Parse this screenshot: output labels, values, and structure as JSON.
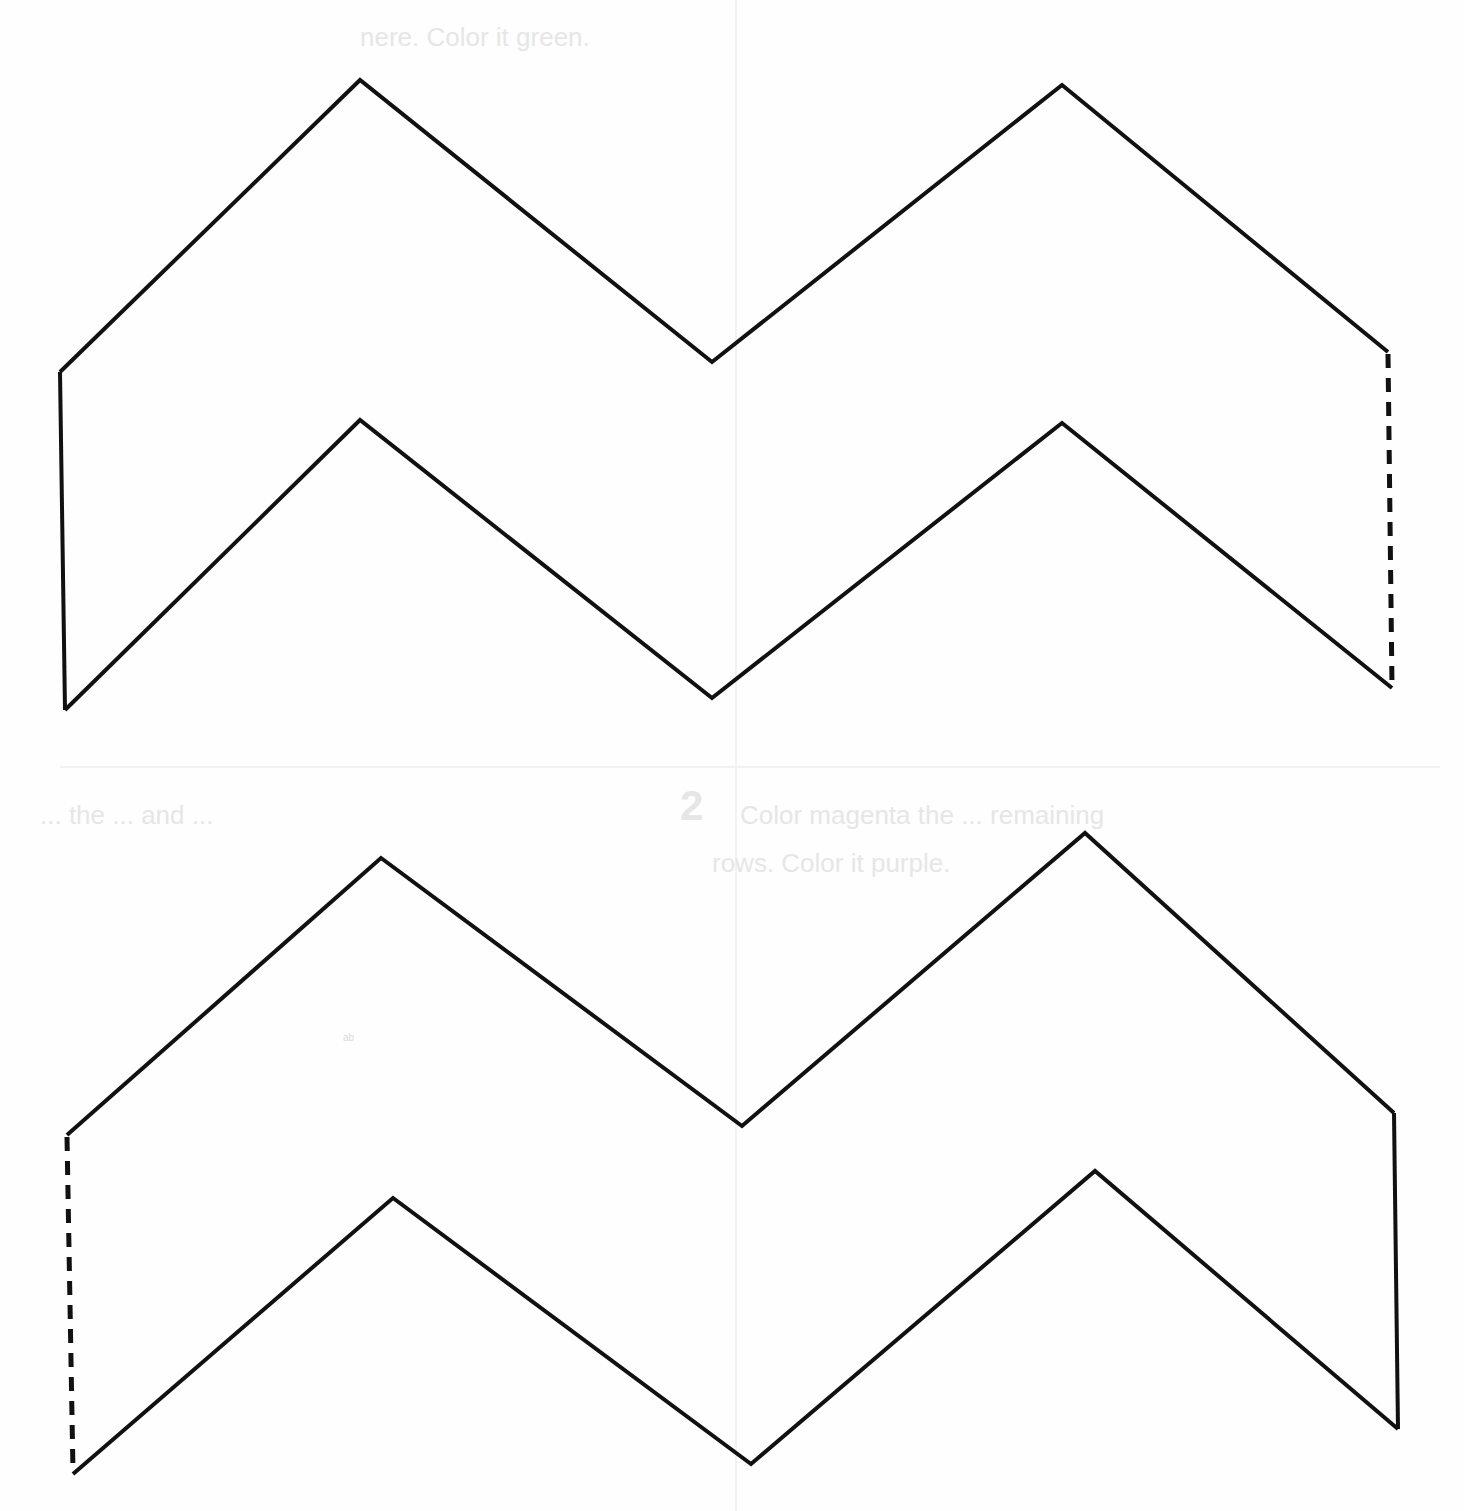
{
  "template": {
    "type": "chevron cut-out template",
    "stroke_color": "#111111",
    "background_color": "#fefefe",
    "shapes": [
      {
        "name": "top-chevron-strip",
        "outline_points": "360,80 712,362 1062,85 1388,352",
        "bottom_points": "65,710 360,420 712,698 1062,423 1392,688",
        "left_edge": "60,372 65,710",
        "left_top_edge": "60,372 360,80",
        "fold_edge": "1388,352 1392,688",
        "fold_style": "dashed"
      },
      {
        "name": "bottom-chevron-strip",
        "outline_points": "67,1135 381,858 742,1126 1085,833 1394,1113",
        "bottom_points": "73,1474 393,1198 751,1464 1095,1171 1398,1429",
        "right_edge": "1394,1113 1398,1429",
        "fold_edge": "67,1135 73,1474",
        "fold_style": "dashed"
      }
    ]
  },
  "bleed_through_text": {
    "top_left_line": "nere. Color it green.",
    "middle_number": "2",
    "middle_line_1": "Color magenta the ... remaining",
    "middle_line_2": "rows. Color it purple.",
    "middle_left_fragment": "... the ... and ...",
    "small_scribble": "ab"
  }
}
